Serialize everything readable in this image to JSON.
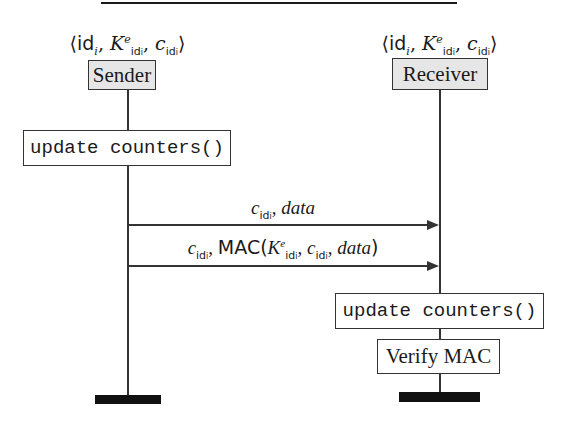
{
  "diagram": {
    "type": "sequence-diagram",
    "participants": [
      {
        "name": "Sender",
        "state_tuple": "⟨id_i, K^e_{id_i}, c_{id_i}⟩",
        "tuple_parts": {
          "open": "⟨",
          "id": "id",
          "id_sub": "i",
          "k": "K",
          "k_sup": "e",
          "k_sub": "id",
          "k_subsub": "i",
          "c": "c",
          "c_sub": "id",
          "c_subsub": "i",
          "close": "⟩",
          "sep": ", "
        }
      },
      {
        "name": "Receiver",
        "state_tuple": "⟨id_i, K^e_{id_i}, c_{id_i}⟩",
        "tuple_parts": {
          "open": "⟨",
          "id": "id",
          "id_sub": "i",
          "k": "K",
          "k_sup": "e",
          "k_sub": "id",
          "k_subsub": "i",
          "c": "c",
          "c_sub": "id",
          "c_subsub": "i",
          "close": "⟩",
          "sep": ", "
        }
      }
    ],
    "sender_steps": [
      {
        "label": "update counters()"
      }
    ],
    "messages": [
      {
        "from": "Sender",
        "to": "Receiver",
        "label": "c_{id_i}, data",
        "parts": {
          "c": "c",
          "c_sub": "id",
          "c_subsub": "i",
          "sep": ", ",
          "payload": "data"
        }
      },
      {
        "from": "Sender",
        "to": "Receiver",
        "label": "c_{id_i}, MAC(K^e_{id_i}, c_{id_i}, data)",
        "parts": {
          "c": "c",
          "c_sub": "id",
          "c_subsub": "i",
          "sep": ", ",
          "fn": "MAC",
          "open": "(",
          "k": "K",
          "k_sup": "e",
          "k_sub": "id",
          "k_subsub": "i",
          "payload": "data",
          "close": ")"
        }
      }
    ],
    "receiver_steps": [
      {
        "label": "update counters()"
      },
      {
        "label": "Verify MAC"
      }
    ]
  }
}
